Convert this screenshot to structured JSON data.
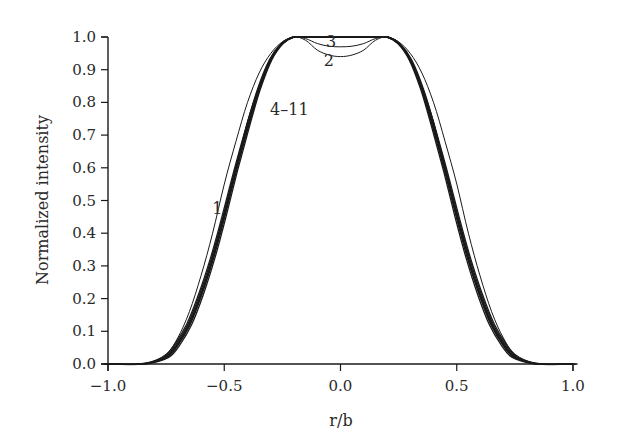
{
  "chart_data": {
    "type": "line",
    "title": "",
    "xlabel": "r/b",
    "ylabel": "Normalized intensity",
    "xlim": [
      -1.0,
      1.0
    ],
    "ylim": [
      0.0,
      1.0
    ],
    "grid": false,
    "legend": "none (curves labeled inline)",
    "x_ticks": [
      -1.0,
      -0.5,
      0.0,
      0.5,
      1.0
    ],
    "x_tick_labels": [
      "−1.0",
      "−0.5",
      "0.0",
      "0.5",
      "1.0"
    ],
    "y_ticks": [
      0.0,
      0.1,
      0.2,
      0.3,
      0.4,
      0.5,
      0.6,
      0.7,
      0.8,
      0.9,
      1.0
    ],
    "y_tick_labels": [
      "0.0",
      "0.1",
      "0.2",
      "0.3",
      "0.4",
      "0.5",
      "0.6",
      "0.7",
      "0.8",
      "0.9",
      "1.0"
    ],
    "annotations": [
      {
        "text": "1",
        "x": -0.53,
        "y": 0.46
      },
      {
        "text": "2",
        "x": -0.05,
        "y": 0.91
      },
      {
        "text": "3",
        "x": -0.04,
        "y": 0.97
      },
      {
        "text": "4–11",
        "x": -0.22,
        "y": 0.76
      }
    ],
    "series": [
      {
        "name": "1",
        "x": [
          -1.0,
          -0.85,
          -0.75,
          -0.7,
          -0.65,
          -0.6,
          -0.55,
          -0.5,
          -0.45,
          -0.4,
          -0.35,
          -0.3,
          -0.25,
          -0.2,
          -0.15,
          0.0,
          0.15,
          0.2,
          0.25,
          0.3,
          0.35,
          0.4,
          0.45,
          0.5,
          0.55,
          0.6,
          0.65,
          0.7,
          0.75,
          0.85,
          1.0
        ],
        "y": [
          0.0,
          0.0,
          0.03,
          0.08,
          0.16,
          0.27,
          0.4,
          0.55,
          0.68,
          0.8,
          0.89,
          0.95,
          0.985,
          1.0,
          1.0,
          1.0,
          1.0,
          1.0,
          0.985,
          0.95,
          0.89,
          0.8,
          0.68,
          0.55,
          0.4,
          0.27,
          0.16,
          0.08,
          0.03,
          0.0,
          0.0
        ]
      },
      {
        "name": "2",
        "x": [
          -1.0,
          -0.85,
          -0.75,
          -0.7,
          -0.65,
          -0.6,
          -0.55,
          -0.5,
          -0.45,
          -0.4,
          -0.35,
          -0.3,
          -0.25,
          -0.2,
          -0.15,
          -0.1,
          -0.05,
          0.0,
          0.05,
          0.1,
          0.15,
          0.2,
          0.25,
          0.3,
          0.35,
          0.4,
          0.45,
          0.5,
          0.55,
          0.6,
          0.65,
          0.7,
          0.75,
          0.85,
          1.0
        ],
        "y": [
          0.0,
          0.0,
          0.02,
          0.06,
          0.12,
          0.21,
          0.32,
          0.46,
          0.6,
          0.74,
          0.85,
          0.93,
          0.98,
          1.0,
          0.99,
          0.96,
          0.945,
          0.94,
          0.945,
          0.96,
          0.99,
          1.0,
          0.98,
          0.93,
          0.85,
          0.74,
          0.6,
          0.46,
          0.32,
          0.21,
          0.12,
          0.06,
          0.02,
          0.0,
          0.0
        ]
      },
      {
        "name": "3",
        "x": [
          -1.0,
          -0.85,
          -0.75,
          -0.7,
          -0.65,
          -0.6,
          -0.55,
          -0.5,
          -0.45,
          -0.4,
          -0.35,
          -0.3,
          -0.25,
          -0.2,
          -0.15,
          -0.1,
          -0.05,
          0.0,
          0.05,
          0.1,
          0.15,
          0.2,
          0.25,
          0.3,
          0.35,
          0.4,
          0.45,
          0.5,
          0.55,
          0.6,
          0.65,
          0.7,
          0.75,
          0.85,
          1.0
        ],
        "y": [
          0.0,
          0.0,
          0.02,
          0.06,
          0.12,
          0.21,
          0.32,
          0.46,
          0.6,
          0.74,
          0.85,
          0.93,
          0.98,
          1.0,
          0.995,
          0.98,
          0.972,
          0.97,
          0.972,
          0.98,
          0.995,
          1.0,
          0.98,
          0.93,
          0.85,
          0.74,
          0.6,
          0.46,
          0.32,
          0.21,
          0.12,
          0.06,
          0.02,
          0.0,
          0.0
        ]
      },
      {
        "name": "4–11",
        "x": [
          -1.0,
          -0.85,
          -0.75,
          -0.7,
          -0.65,
          -0.6,
          -0.55,
          -0.5,
          -0.45,
          -0.4,
          -0.35,
          -0.3,
          -0.25,
          -0.2,
          -0.15,
          0.0,
          0.15,
          0.2,
          0.25,
          0.3,
          0.35,
          0.4,
          0.45,
          0.5,
          0.55,
          0.6,
          0.65,
          0.7,
          0.75,
          0.85,
          1.0
        ],
        "y": [
          0.0,
          0.0,
          0.02,
          0.06,
          0.12,
          0.21,
          0.32,
          0.45,
          0.59,
          0.72,
          0.84,
          0.93,
          0.98,
          1.0,
          1.0,
          1.0,
          1.0,
          1.0,
          0.98,
          0.93,
          0.84,
          0.72,
          0.59,
          0.45,
          0.32,
          0.21,
          0.12,
          0.06,
          0.02,
          0.0,
          0.0
        ]
      }
    ]
  },
  "layout": {
    "plot": {
      "x0": 108,
      "x1": 573,
      "y0": 364,
      "y1": 37
    },
    "line_color": "#1a1a1a",
    "text_color": "#2a2a2a",
    "background": "#ffffff"
  }
}
